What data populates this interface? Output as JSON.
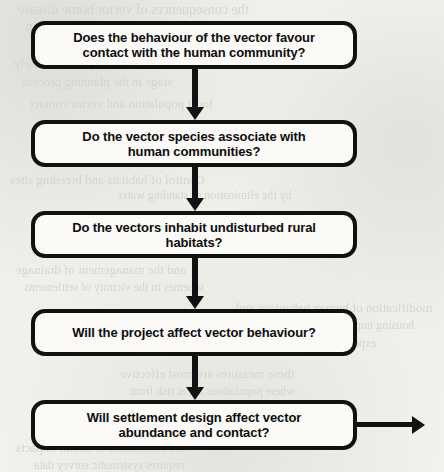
{
  "document": {
    "type": "scanned-flowchart",
    "background_color": "#f2f1ed",
    "ink_color": "#111111",
    "box_fill_color": "#fbfaf7",
    "ghost_text_color": "#d4d2cc"
  },
  "flowchart": {
    "orientation": "vertical",
    "node_shape": "rounded-rectangle",
    "nodes": [
      {
        "id": "node-1",
        "text": "Does the behaviour of the vector favour\ncontact with the human community?",
        "lines": [
          "Does the behaviour of the vector favour",
          "contact with the human community?"
        ],
        "x": 31,
        "y": 21,
        "width": 326,
        "height": 48
      },
      {
        "id": "node-2",
        "text": "Do the vector species associate with\nhuman communities?",
        "lines": [
          "Do the vector species associate with",
          "human communities?"
        ],
        "x": 31,
        "y": 120,
        "width": 326,
        "height": 47
      },
      {
        "id": "node-3",
        "text": "Do the vectors inhabit undisturbed rural\nhabitats?",
        "lines": [
          "Do the vectors inhabit undisturbed rural",
          "habitats?"
        ],
        "x": 31,
        "y": 211,
        "width": 326,
        "height": 47
      },
      {
        "id": "node-4",
        "text": "Will the project affect vector behaviour?",
        "lines": [
          "Will the project affect vector behaviour?"
        ],
        "x": 31,
        "y": 309,
        "width": 326,
        "height": 47
      },
      {
        "id": "node-5",
        "text": "Will settlement design affect vector\nabundance and contact?",
        "lines": [
          "Will settlement design affect vector",
          "abundance and contact?"
        ],
        "x": 31,
        "y": 400,
        "width": 326,
        "height": 50
      }
    ],
    "connectors": [
      {
        "id": "connector-1",
        "from": "node-1",
        "to": "node-2",
        "direction": "down",
        "x": 184,
        "y": 69,
        "length": 51
      },
      {
        "id": "connector-2",
        "from": "node-2",
        "to": "node-3",
        "direction": "down",
        "x": 184,
        "y": 167,
        "length": 44
      },
      {
        "id": "connector-3",
        "from": "node-3",
        "to": "node-4",
        "direction": "down",
        "x": 184,
        "y": 258,
        "length": 51
      },
      {
        "id": "connector-4",
        "from": "node-4",
        "to": "node-5",
        "direction": "down",
        "x": 184,
        "y": 356,
        "length": 44
      },
      {
        "id": "connector-5",
        "from": "node-5",
        "to": "offpage",
        "direction": "right",
        "x": 357,
        "y": 415,
        "length": 68
      }
    ]
  },
  "ghost_text": {
    "note": "illegible show-through from reverse page",
    "fragments": [
      {
        "text": "the consequences of vector borne disease",
        "x": 18,
        "y": 2,
        "size": 14
      },
      {
        "text": "be considered as part of the project design",
        "x": 26,
        "y": 18,
        "size": 13
      },
      {
        "text": "these measures are adopted at an early",
        "x": 14,
        "y": 56,
        "size": 13
      },
      {
        "text": "stage in the planning process",
        "x": 22,
        "y": 74,
        "size": 13
      },
      {
        "text": "local population and vector contact",
        "x": 30,
        "y": 96,
        "size": 13
      },
      {
        "text": "Control of habitats and breeding sites",
        "x": 10,
        "y": 172,
        "size": 13
      },
      {
        "text": "by the elimination of standing water",
        "x": 118,
        "y": 188,
        "size": 12
      },
      {
        "text": "and the management of drainage",
        "x": 16,
        "y": 262,
        "size": 13
      },
      {
        "text": "schemes in the vicinity of settlements",
        "x": 24,
        "y": 280,
        "size": 12
      },
      {
        "text": "modification of human behaviour and",
        "x": 236,
        "y": 300,
        "size": 13
      },
      {
        "text": "housing improvements may reduce",
        "x": 246,
        "y": 318,
        "size": 12
      },
      {
        "text": "exposure to biting vectors",
        "x": 252,
        "y": 336,
        "size": 12
      },
      {
        "text": "these measures are most effective",
        "x": 120,
        "y": 366,
        "size": 13
      },
      {
        "text": "where populations are at risk from",
        "x": 130,
        "y": 384,
        "size": 12
      },
      {
        "text": "vector borne disease",
        "x": 150,
        "y": 420,
        "size": 14
      },
      {
        "text": "the assessment of health impacts",
        "x": 16,
        "y": 440,
        "size": 13
      },
      {
        "text": "requires systematic survey data",
        "x": 34,
        "y": 458,
        "size": 12
      }
    ]
  }
}
